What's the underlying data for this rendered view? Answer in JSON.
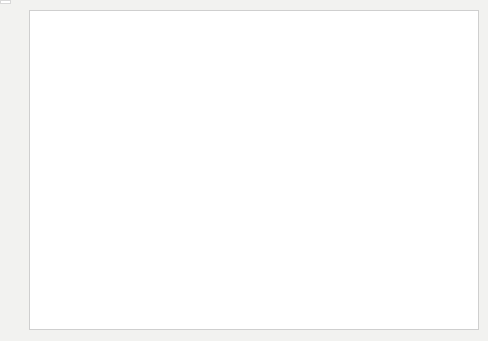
{
  "figure": {
    "y_axis_label": "GREENHOUSE GAS EMISSIONS (GT CO₂ EQ PER YEAR)",
    "x_axis_label": "YEAR"
  },
  "key": {
    "title": "KEY",
    "items": [
      {
        "label": "Fluorinated gases",
        "color": "#1b1b1b",
        "name": "fluorinated-gases"
      },
      {
        "label": "N₂O",
        "color": "#8e8e8e",
        "name": "n2o"
      },
      {
        "label": "CH₄",
        "color": "#e3e3e0",
        "name": "ch4"
      },
      {
        "label": "CO₂ from forestry and other land use",
        "color": "#7e7e7e",
        "name": "co2-forestry"
      },
      {
        "label": "CO₂ from fossil fuel and industrial processes",
        "color": "#b9b9b6",
        "name": "co2-fossil"
      }
    ]
  },
  "annotations": {
    "bracket_left": {
      "line1": "+1.3% per year",
      "line2": "(1970–2000)"
    },
    "bracket_right": {
      "line1": "+2.2% per year",
      "line2": "(2000–2010)"
    }
  },
  "callouts": [
    {
      "year": 1970,
      "total": "27Gt",
      "fgas": "0.44%",
      "n2o": "7.9%",
      "ch4": "19%",
      "forestry": "17%",
      "fossil": "55%"
    },
    {
      "year": 1980,
      "total": "33Gt",
      "fgas": "0.67%",
      "n2o": "7.9%",
      "ch4": "18%",
      "forestry": "15%",
      "fossil": "58%"
    },
    {
      "year": 1990,
      "total": "38Gt",
      "fgas": "0.81%",
      "n2o": "7.4%",
      "ch4": "18%",
      "forestry": "16%",
      "fossil": "59%"
    },
    {
      "year": 2000,
      "total": "40Gt",
      "fgas": "1.3%",
      "n2o": "6.9%",
      "ch4": "16%",
      "forestry": "13%",
      "fossil": "62%"
    },
    {
      "year": 2010,
      "total": "49Gt",
      "fgas": "2.0%",
      "n2o": "6.2%",
      "ch4": "16%",
      "forestry": "11%",
      "fossil": "65%"
    }
  ],
  "chart_data": {
    "type": "area",
    "stacked": true,
    "title": "",
    "xlabel": "YEAR",
    "ylabel": "GREENHOUSE GAS EMISSIONS (GT CO2 EQ PER YEAR)",
    "xlim": [
      1970,
      2010
    ],
    "ylim": [
      0,
      55
    ],
    "yticks": [
      0,
      10,
      20,
      30,
      40,
      50
    ],
    "xticks": [
      1970,
      1975,
      1980,
      1985,
      1990,
      1995,
      2000,
      2005,
      2010
    ],
    "grid": false,
    "legend_position": "inside-bottom-right",
    "x": [
      1970,
      1971,
      1972,
      1973,
      1974,
      1975,
      1976,
      1977,
      1978,
      1979,
      1980,
      1981,
      1982,
      1983,
      1984,
      1985,
      1986,
      1987,
      1988,
      1989,
      1990,
      1991,
      1992,
      1993,
      1994,
      1995,
      1996,
      1997,
      1998,
      1999,
      2000,
      2001,
      2002,
      2003,
      2004,
      2005,
      2006,
      2007,
      2008,
      2009,
      2010
    ],
    "series": [
      {
        "name": "CO2 from fossil fuel and industrial processes",
        "color": "#b9b9b6",
        "values": [
          14.9,
          15.5,
          16.0,
          16.8,
          16.7,
          16.8,
          17.6,
          18.1,
          18.5,
          19.2,
          19.1,
          18.6,
          18.4,
          18.5,
          19.3,
          19.9,
          20.3,
          21.0,
          21.7,
          22.0,
          22.2,
          22.4,
          22.3,
          22.4,
          22.6,
          23.1,
          23.8,
          24.1,
          24.1,
          24.2,
          24.8,
          25.2,
          25.6,
          26.8,
          28.2,
          29.3,
          30.4,
          31.4,
          31.9,
          31.5,
          33.8
        ]
      },
      {
        "name": "CO2 from forestry and other land use",
        "color": "#7e7e7e",
        "values": [
          4.6,
          4.6,
          4.7,
          4.8,
          4.9,
          4.9,
          5.0,
          5.1,
          5.2,
          5.2,
          4.9,
          5.0,
          5.1,
          5.3,
          5.3,
          5.4,
          5.5,
          5.7,
          5.9,
          6.0,
          6.1,
          6.1,
          6.0,
          5.9,
          5.9,
          5.9,
          5.8,
          6.5,
          5.8,
          5.6,
          5.2,
          5.2,
          5.3,
          5.4,
          5.5,
          5.5,
          5.4,
          5.4,
          5.4,
          5.4,
          5.4
        ]
      },
      {
        "name": "CH4",
        "color": "#e3e3e0",
        "values": [
          5.1,
          5.2,
          5.3,
          5.4,
          5.4,
          5.5,
          5.6,
          5.7,
          5.8,
          5.9,
          5.9,
          5.9,
          6.0,
          6.0,
          6.1,
          6.2,
          6.3,
          6.4,
          6.5,
          6.6,
          6.8,
          6.8,
          6.8,
          6.8,
          6.8,
          6.9,
          6.9,
          7.0,
          6.9,
          6.9,
          6.4,
          6.5,
          6.6,
          6.8,
          7.0,
          7.2,
          7.4,
          7.5,
          7.6,
          7.7,
          7.8
        ]
      },
      {
        "name": "N2O",
        "color": "#8e8e8e",
        "values": [
          2.1,
          2.1,
          2.2,
          2.2,
          2.2,
          2.3,
          2.3,
          2.4,
          2.4,
          2.5,
          2.6,
          2.6,
          2.6,
          2.6,
          2.7,
          2.7,
          2.7,
          2.8,
          2.8,
          2.8,
          2.8,
          2.8,
          2.8,
          2.8,
          2.8,
          2.8,
          2.8,
          2.9,
          2.9,
          2.9,
          2.8,
          2.8,
          2.8,
          2.8,
          2.9,
          2.9,
          2.9,
          3.0,
          3.0,
          3.0,
          3.0
        ]
      },
      {
        "name": "Fluorinated gases",
        "color": "#1b1b1b",
        "values": [
          0.12,
          0.13,
          0.14,
          0.15,
          0.16,
          0.17,
          0.18,
          0.19,
          0.2,
          0.21,
          0.22,
          0.23,
          0.24,
          0.25,
          0.26,
          0.27,
          0.28,
          0.29,
          0.3,
          0.31,
          0.31,
          0.32,
          0.33,
          0.34,
          0.36,
          0.38,
          0.42,
          0.46,
          0.5,
          0.54,
          0.52,
          0.55,
          0.58,
          0.62,
          0.68,
          0.74,
          0.8,
          0.86,
          0.92,
          0.96,
          0.98
        ]
      }
    ]
  }
}
